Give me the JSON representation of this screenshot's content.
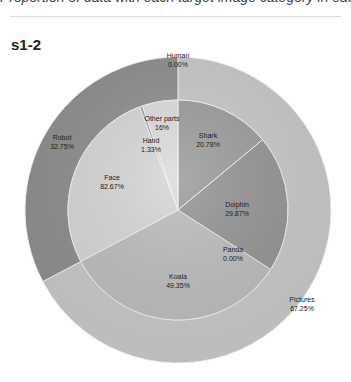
{
  "header": {
    "cut_text": "Proportion of data with each target image category in each stage"
  },
  "title": "s1-2",
  "colors": {
    "robot": "#8f8f8f",
    "pictures": "#c9c9c9",
    "face": "#d6d6d6",
    "hand": "#a8a8a8",
    "other_parts": "#dcdcdc",
    "shark": "#9c9c9c",
    "dolphin": "#959595",
    "panda": "#b0b0b0",
    "koala": "#bdbdbd"
  },
  "chart_data": {
    "type": "sunburst",
    "title": "s1-2",
    "outer_ring": [
      {
        "label": "Human",
        "value": "0.00%",
        "pct": 0.0
      },
      {
        "label": "Pictures",
        "value": "67.25%",
        "pct": 67.25
      },
      {
        "label": "Robot",
        "value": "32.75%",
        "pct": 32.75
      }
    ],
    "inner_ring": {
      "Pictures": [
        {
          "label": "Shark",
          "value": "20.78%",
          "pct": 20.78
        },
        {
          "label": "Dolphin",
          "value": "29.87%",
          "pct": 29.87
        },
        {
          "label": "Panda",
          "value": "0.00%",
          "pct": 0.0
        },
        {
          "label": "Koala",
          "value": "49.35%",
          "pct": 49.35
        }
      ],
      "Robot": [
        {
          "label": "Face",
          "value": "82.67%",
          "pct": 82.67
        },
        {
          "label": "Hand",
          "value": "1.33%",
          "pct": 1.33
        },
        {
          "label": "Other parts",
          "value": "16%",
          "pct": 16.0
        }
      ]
    }
  },
  "labels": {
    "human": {
      "name": "Human",
      "value": "0.00%"
    },
    "pictures": {
      "name": "Pictures",
      "value": "67.25%"
    },
    "robot": {
      "name": "Robot",
      "value": "32.75%"
    },
    "shark": {
      "name": "Shark",
      "value": "20.78%"
    },
    "dolphin": {
      "name": "Dolphin",
      "value": "29.87%"
    },
    "panda": {
      "name": "Panda",
      "value": "0.00%"
    },
    "koala": {
      "name": "Koala",
      "value": "49.35%"
    },
    "face": {
      "name": "Face",
      "value": "82.67%"
    },
    "hand": {
      "name": "Hand",
      "value": "1.33%"
    },
    "other_parts": {
      "name": "Other parts",
      "value": "16%"
    }
  }
}
